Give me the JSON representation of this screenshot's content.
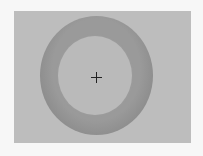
{
  "figure": {
    "colors": {
      "background": "#f7f7f7",
      "panel": "#bdbdbd",
      "ring": "#8c8c8c",
      "inner_disc": "#bababa",
      "crosshair": "#222222"
    }
  }
}
